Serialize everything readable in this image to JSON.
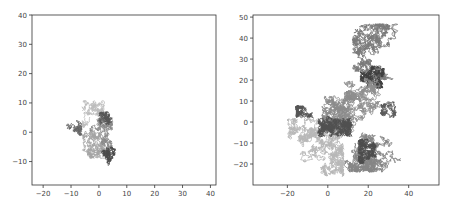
{
  "chart_data": [
    {
      "type": "line",
      "title": "",
      "xlabel": "",
      "ylabel": "",
      "xlim": [
        -24,
        42
      ],
      "ylim": [
        -18,
        40
      ],
      "xticks": [
        -20,
        -10,
        0,
        10,
        20,
        30,
        40
      ],
      "yticks": [
        -10,
        0,
        10,
        20,
        30,
        40
      ],
      "grid": false,
      "legend": null,
      "description": "Overlaid 2D random walks (grayscale), clustered near origin",
      "frame": {
        "left": 32,
        "top": 15,
        "right": 216,
        "bottom": 185
      },
      "series": [
        {
          "name": "walk-light",
          "color": "#bdbdbd",
          "seed": 11,
          "start": [
            -5,
            8
          ],
          "steps": 420,
          "step": 0.55,
          "bounds": [
            -9,
            2,
            -2,
            11
          ]
        },
        {
          "name": "walk-mid",
          "color": "#8a8a8a",
          "seed": 23,
          "start": [
            -3,
            0
          ],
          "steps": 700,
          "step": 0.6,
          "bounds": [
            -13,
            5,
            -7,
            5
          ]
        },
        {
          "name": "walk-mid2",
          "color": "#a5a5a5",
          "seed": 37,
          "start": [
            0,
            -2
          ],
          "steps": 600,
          "step": 0.6,
          "bounds": [
            -6,
            4,
            -9,
            4
          ]
        },
        {
          "name": "walk-dark",
          "color": "#555555",
          "seed": 51,
          "start": [
            2,
            4
          ],
          "steps": 260,
          "step": 0.5,
          "bounds": [
            0,
            5,
            0,
            7
          ]
        },
        {
          "name": "walk-dark2",
          "color": "#4a4a4a",
          "seed": 67,
          "start": [
            3,
            -7
          ],
          "steps": 300,
          "step": 0.55,
          "bounds": [
            1,
            6,
            -12,
            -5
          ]
        },
        {
          "name": "walk-dark3",
          "color": "#666666",
          "seed": 79,
          "start": [
            -10,
            2
          ],
          "steps": 200,
          "step": 0.55,
          "bounds": [
            -13,
            -6,
            -3,
            5
          ]
        }
      ]
    },
    {
      "type": "line",
      "title": "",
      "xlabel": "",
      "ylabel": "",
      "xlim": [
        -37,
        55
      ],
      "ylim": [
        -30,
        51
      ],
      "xticks": [
        -20,
        0,
        20,
        40
      ],
      "yticks": [
        -20,
        -10,
        0,
        10,
        20,
        30,
        40,
        50
      ],
      "grid": false,
      "legend": null,
      "description": "Overlaid 2D random walks (grayscale) spreading widely from origin",
      "frame": {
        "left": 253,
        "top": 15,
        "right": 439,
        "bottom": 185
      },
      "series": [
        {
          "name": "walk-light",
          "color": "#b8b8b8",
          "seed": 101,
          "start": [
            -5,
            -8
          ],
          "steps": 2200,
          "step": 0.9,
          "bounds": [
            -20,
            8,
            -26,
            2
          ]
        },
        {
          "name": "walk-mid",
          "color": "#8c8c8c",
          "seed": 131,
          "start": [
            5,
            5
          ],
          "steps": 2200,
          "step": 0.9,
          "bounds": [
            -3,
            14,
            -6,
            15
          ]
        },
        {
          "name": "walk-mid-upper",
          "color": "#7a7a7a",
          "seed": 151,
          "start": [
            15,
            25
          ],
          "steps": 1600,
          "step": 0.95,
          "bounds": [
            12,
            38,
            20,
            47
          ]
        },
        {
          "name": "walk-dark-upper",
          "color": "#3f3f3f",
          "seed": 171,
          "start": [
            22,
            22
          ],
          "steps": 700,
          "step": 0.8,
          "bounds": [
            16,
            28,
            16,
            27
          ]
        },
        {
          "name": "walk-mid-right",
          "color": "#858585",
          "seed": 191,
          "start": [
            20,
            -10
          ],
          "steps": 1800,
          "step": 0.95,
          "bounds": [
            8,
            36,
            -24,
            -5
          ]
        },
        {
          "name": "walk-dark-right",
          "color": "#4d4d4d",
          "seed": 211,
          "start": [
            20,
            -14
          ],
          "steps": 700,
          "step": 0.8,
          "bounds": [
            15,
            24,
            -20,
            -8
          ]
        },
        {
          "name": "walk-dark-mid",
          "color": "#505050",
          "seed": 233,
          "start": [
            3,
            -2
          ],
          "steps": 1200,
          "step": 0.85,
          "bounds": [
            -5,
            12,
            -7,
            6
          ]
        },
        {
          "name": "walk-dark-left",
          "color": "#555555",
          "seed": 257,
          "start": [
            -14,
            5
          ],
          "steps": 350,
          "step": 0.8,
          "bounds": [
            -16,
            -4,
            2,
            8
          ]
        },
        {
          "name": "walk-mid-ne",
          "color": "#8f8f8f",
          "seed": 277,
          "start": [
            14,
            12
          ],
          "steps": 900,
          "step": 0.9,
          "bounds": [
            8,
            34,
            0,
            22
          ]
        },
        {
          "name": "walk-dark-ne",
          "color": "#5a5a5a",
          "seed": 293,
          "start": [
            30,
            8
          ],
          "steps": 300,
          "step": 0.7,
          "bounds": [
            26,
            34,
            2,
            12
          ]
        }
      ]
    }
  ]
}
